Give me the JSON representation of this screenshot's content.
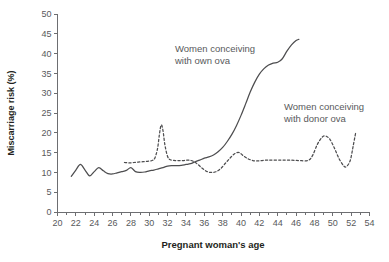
{
  "chart_data": {
    "type": "line",
    "title": "",
    "xlabel": "Pregnant woman's age",
    "ylabel": "Miscarriage risk (%)",
    "xlim": [
      20,
      54
    ],
    "ylim": [
      0,
      50
    ],
    "xticks": [
      20,
      22,
      24,
      26,
      28,
      30,
      32,
      34,
      36,
      38,
      40,
      42,
      44,
      46,
      48,
      50,
      52,
      54
    ],
    "xtick_labels": [
      "20",
      "22",
      "24",
      "26",
      "28",
      "30",
      "32",
      "34",
      "36",
      "38",
      "40",
      "42",
      "44",
      "46",
      "48",
      "50",
      "52",
      "54"
    ],
    "xminor_step": 1,
    "yticks": [
      0,
      5,
      10,
      15,
      20,
      25,
      30,
      35,
      40,
      45,
      50
    ],
    "ytick_labels": [
      "0",
      "5",
      "10",
      "15",
      "20",
      "25",
      "30",
      "35",
      "40",
      "45",
      "50"
    ],
    "grid": false,
    "legend": "annotations-inline",
    "line_color": "#4d4d4f",
    "text_color": "#58595b",
    "series": [
      {
        "name": "Women conceiving with own ova",
        "style": "solid",
        "x": [
          21.5,
          22.0,
          22.5,
          23.0,
          23.5,
          24.0,
          24.5,
          25.0,
          25.5,
          26.0,
          26.5,
          27.0,
          27.5,
          28.0,
          28.5,
          29.0,
          29.5,
          30.0,
          30.5,
          31.0,
          31.5,
          32.0,
          32.5,
          33.0,
          33.5,
          34.0,
          34.5,
          35.0,
          35.5,
          36.0,
          36.5,
          37.0,
          37.5,
          38.0,
          38.5,
          39.0,
          39.5,
          40.0,
          40.5,
          41.0,
          41.5,
          42.0,
          42.5,
          43.0,
          43.5,
          44.0,
          44.5,
          45.0,
          45.5,
          46.0,
          46.3
        ],
        "y": [
          9.0,
          10.6,
          12.0,
          10.6,
          9.1,
          10.2,
          11.2,
          10.4,
          9.7,
          9.6,
          9.9,
          10.2,
          10.5,
          11.2,
          10.2,
          10.0,
          10.1,
          10.4,
          10.6,
          10.9,
          11.2,
          11.6,
          11.7,
          11.7,
          11.8,
          12.0,
          12.2,
          12.7,
          13.1,
          13.6,
          13.9,
          14.4,
          15.2,
          16.3,
          17.8,
          19.6,
          21.8,
          24.4,
          27.3,
          30.3,
          32.8,
          34.8,
          36.2,
          37.1,
          37.6,
          37.8,
          38.7,
          40.6,
          42.2,
          43.3,
          43.6
        ]
      },
      {
        "name": "Women conceiving with donor ova",
        "style": "dashed",
        "x": [
          27.3,
          27.8,
          28.3,
          28.8,
          29.3,
          29.8,
          30.3,
          30.6,
          30.9,
          31.1,
          31.3,
          31.5,
          31.7,
          32.0,
          32.3,
          32.8,
          33.3,
          33.8,
          34.3,
          34.8,
          35.3,
          35.8,
          36.3,
          36.8,
          37.3,
          37.8,
          38.3,
          38.8,
          39.3,
          39.8,
          40.3,
          40.8,
          41.3,
          41.8,
          42.3,
          42.8,
          43.3,
          44.3,
          45.3,
          46.3,
          47.3,
          47.8,
          48.3,
          48.8,
          49.2,
          49.7,
          50.2,
          50.7,
          51.2,
          51.5,
          51.9,
          52.2,
          52.5
        ],
        "y": [
          12.5,
          12.4,
          12.5,
          12.6,
          12.7,
          12.8,
          13.0,
          13.6,
          16.0,
          19.5,
          22.0,
          20.5,
          17.0,
          14.0,
          13.2,
          13.0,
          13.0,
          13.0,
          13.1,
          12.8,
          12.0,
          11.0,
          10.2,
          10.0,
          10.2,
          11.0,
          12.3,
          13.6,
          14.7,
          15.0,
          14.1,
          13.4,
          13.0,
          12.9,
          13.0,
          13.1,
          13.1,
          13.1,
          13.1,
          13.0,
          13.0,
          14.3,
          17.0,
          18.8,
          19.2,
          18.3,
          16.0,
          13.4,
          11.6,
          11.5,
          13.0,
          16.4,
          20.1
        ]
      }
    ],
    "annotations": [
      {
        "id": "annotation-own-ova",
        "lines": [
          "Women conceiving",
          "with own ova"
        ],
        "x_px": 175,
        "y_px": 52
      },
      {
        "id": "annotation-donor-ova",
        "lines": [
          "Women conceiving",
          "with donor ova"
        ],
        "x_px": 284,
        "y_px": 110
      }
    ]
  }
}
